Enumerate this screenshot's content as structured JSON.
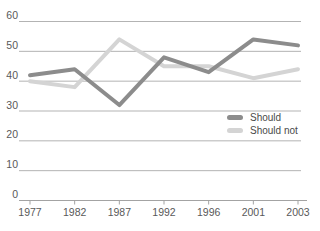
{
  "chart_data": {
    "type": "line",
    "categories": [
      "1977",
      "1982",
      "1987",
      "1992",
      "1996",
      "2001",
      "2003"
    ],
    "series": [
      {
        "name": "Should",
        "color": "#8c8c8c",
        "values": [
          42,
          44,
          32,
          48,
          43,
          54,
          52
        ]
      },
      {
        "name": "Should not",
        "color": "#d4d4d4",
        "values": [
          40,
          38,
          54,
          45,
          45,
          41,
          44
        ]
      }
    ],
    "title": "",
    "xlabel": "",
    "ylabel": "",
    "ylim": [
      0,
      60
    ],
    "yticks": [
      "0",
      "10",
      "20",
      "30",
      "40",
      "50",
      "60"
    ],
    "grid": true,
    "legend_position": "right-middle"
  },
  "colors": {
    "gridline": "#b3b3b3",
    "axis_line": "#a3a3a3",
    "tick": "#a3a3a3",
    "label_text": "#595959",
    "legend_text": "#4a4a4a",
    "background": "#ffffff"
  }
}
